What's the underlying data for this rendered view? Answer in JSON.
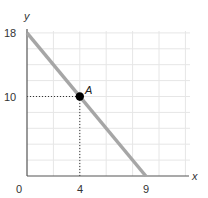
{
  "chart_data": {
    "type": "line",
    "title": "",
    "xlabel": "x",
    "ylabel": "y",
    "xlim": [
      0,
      12
    ],
    "ylim": [
      0,
      19
    ],
    "grid": true,
    "grid_step": {
      "x": 2,
      "y": 2
    },
    "x_ticks": [
      {
        "value": 0,
        "label": "0"
      },
      {
        "value": 4,
        "label": "4"
      },
      {
        "value": 9,
        "label": "9"
      }
    ],
    "y_ticks": [
      {
        "value": 18,
        "label": "18"
      },
      {
        "value": 10,
        "label": "10"
      }
    ],
    "series": [
      {
        "name": "line",
        "x": [
          0,
          9
        ],
        "y": [
          18,
          0
        ],
        "color": "#a6a6a6"
      }
    ],
    "points": [
      {
        "label": "A",
        "x": 4,
        "y": 10,
        "color": "#000000"
      }
    ],
    "guides": [
      {
        "from": [
          0,
          10
        ],
        "to": [
          4,
          10
        ],
        "style": "dotted"
      },
      {
        "from": [
          4,
          0
        ],
        "to": [
          4,
          10
        ],
        "style": "dotted"
      }
    ]
  },
  "labels": {
    "x_axis": "x",
    "y_axis": "y",
    "origin": "0",
    "x_tick_4": "4",
    "x_tick_9": "9",
    "y_tick_18": "18",
    "y_tick_10": "10",
    "point_a": "A"
  },
  "colors": {
    "line": "#a6a6a6",
    "axis": "#555555",
    "grid": "#e6e6e6",
    "point": "#000000"
  }
}
